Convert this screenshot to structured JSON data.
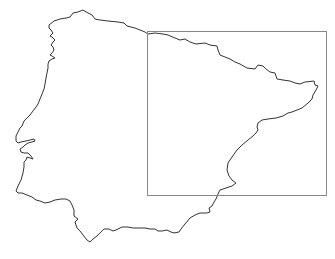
{
  "map": {
    "region": "Iberian Peninsula",
    "background": "#ffffff",
    "coastline_color": "#333333",
    "extent_box_color": "#888888",
    "extent_box": {
      "x": 147,
      "y": 31,
      "width": 179,
      "height": 164
    }
  }
}
